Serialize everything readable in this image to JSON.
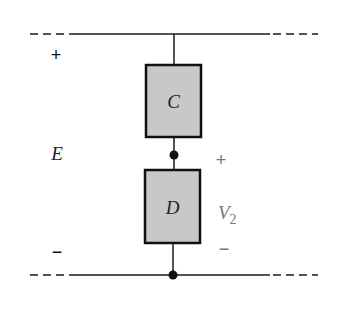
{
  "diagram": {
    "components": [
      {
        "id": "C",
        "label": "C"
      },
      {
        "id": "D",
        "label": "D"
      }
    ],
    "source": {
      "label": "E",
      "plus": "+",
      "minus": "−"
    },
    "voltage": {
      "label": "V",
      "subscript": "2",
      "plus": "+",
      "minus": "−"
    },
    "colors": {
      "wire": "#1a1a1a",
      "box_fill": "#c8c8c8",
      "box_stroke": "#111111",
      "v2_label": "#777777"
    }
  }
}
